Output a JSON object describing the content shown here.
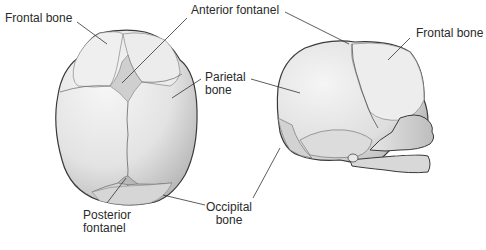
{
  "diagram": {
    "views": [
      "superior view",
      "lateral view"
    ],
    "labels": {
      "frontal_bone_left": "Frontal bone",
      "anterior_fontanel": "Anterior fontanel",
      "frontal_bone_right": "Frontal bone",
      "parietal_line1": "Parietal",
      "parietal_line2": "bone",
      "posterior_line1": "Posterior",
      "posterior_line2": "fontanel",
      "occipital_line1": "Occipital",
      "occipital_line2": "bone"
    },
    "colors": {
      "bone_light": "#f4f4f4",
      "bone_mid": "#d9d9d9",
      "bone_dark": "#a8a8a8",
      "outline": "#3a3a3a",
      "leader": "#333333",
      "text": "#2a2a2a"
    }
  }
}
